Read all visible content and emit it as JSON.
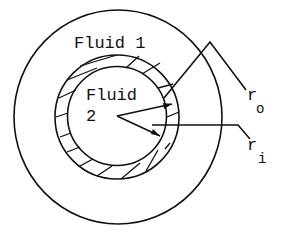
{
  "diagram": {
    "type": "concentric-pipe-cross-section",
    "colors": {
      "line": "#111111",
      "background": "#ffffff"
    },
    "regions": {
      "outer_fluid": {
        "label": "Fluid 1"
      },
      "inner_fluid": {
        "label_line1": "Fluid",
        "label_line2": "2"
      },
      "pipe_wall": {
        "fill": "hatched"
      }
    },
    "dimensions": {
      "outer_radius": {
        "symbol": "r",
        "subscript": "o"
      },
      "inner_radius": {
        "symbol": "r",
        "subscript": "i"
      }
    }
  }
}
